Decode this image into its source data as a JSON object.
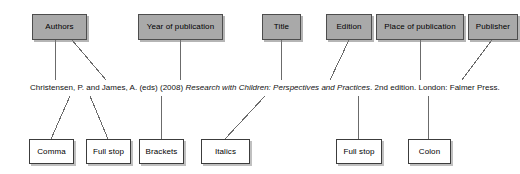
{
  "diagram": {
    "citation": {
      "part1": "Christensen, P. and James, A. (eds) (2008) ",
      "part2_italic": "Research with Children: Perspectives and Practices",
      "part3": ". 2nd edition. London: Falmer Press."
    },
    "colors": {
      "element_box_fill": "#a9a9a9",
      "element_box_border": "#4d4d4d",
      "punctuation_box_fill": "#ffffff",
      "punctuation_box_border": "#3c3c3c",
      "connector_line": "#6b6b6b",
      "text": "#111111",
      "background": "#ffffff"
    },
    "element_labels": [
      {
        "label": "Authors",
        "x": 32,
        "y": 14,
        "w": 55,
        "h": 26
      },
      {
        "label": "Year of publication",
        "x": 138,
        "y": 14,
        "w": 85,
        "h": 26
      },
      {
        "label": "Title",
        "x": 262,
        "y": 14,
        "w": 39,
        "h": 26
      },
      {
        "label": "Edition",
        "x": 326,
        "y": 14,
        "w": 46,
        "h": 26
      },
      {
        "label": "Place of publication",
        "x": 376,
        "y": 14,
        "w": 88,
        "h": 26
      },
      {
        "label": "Publisher",
        "x": 468,
        "y": 14,
        "w": 50,
        "h": 26
      }
    ],
    "punctuation_labels": [
      {
        "label": "Comma",
        "x": 29,
        "y": 139,
        "w": 45,
        "h": 25
      },
      {
        "label": "Full stop",
        "x": 86,
        "y": 139,
        "w": 45,
        "h": 25
      },
      {
        "label": "Brackets",
        "x": 139,
        "y": 139,
        "w": 45,
        "h": 25
      },
      {
        "label": "Italics",
        "x": 201,
        "y": 139,
        "w": 49,
        "h": 25
      },
      {
        "label": "Full stop",
        "x": 336,
        "y": 139,
        "w": 46,
        "h": 25
      },
      {
        "label": "Colon",
        "x": 408,
        "y": 139,
        "w": 43,
        "h": 25
      }
    ]
  }
}
